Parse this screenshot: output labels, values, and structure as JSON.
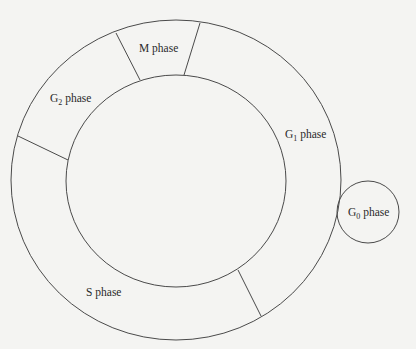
{
  "diagram": {
    "phases": [
      {
        "id": "m",
        "label": "M phase",
        "prefix": "M",
        "sub": "",
        "suffix": " phase"
      },
      {
        "id": "g2",
        "label": "G2 phase",
        "prefix": "G",
        "sub": "2",
        "suffix": " phase"
      },
      {
        "id": "g1",
        "label": "G1 phase",
        "prefix": "G",
        "sub": "1",
        "suffix": " phase"
      },
      {
        "id": "s",
        "label": "S phase",
        "prefix": "S",
        "sub": "",
        "suffix": " phase"
      },
      {
        "id": "g0",
        "label": "G0 phase",
        "prefix": "G",
        "sub": "0",
        "suffix": " phase"
      }
    ],
    "colors": {
      "stroke": "#4a4a4a",
      "text": "#2a2a2a",
      "background": "#f4f4f2"
    }
  }
}
